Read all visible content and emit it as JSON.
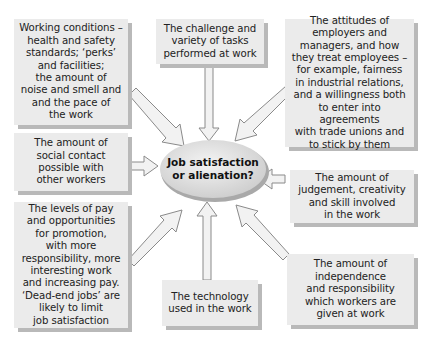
{
  "diagram": {
    "center": {
      "label": "Job satisfaction\nor alienation?"
    },
    "factors": [
      {
        "id": "working-conditions",
        "text": "Working conditions –\nhealth and safety\nstandards; ‘perks’\nand facilities;\nthe amount of\nnoise and smell and\nand the pace of\nthe work"
      },
      {
        "id": "challenge-variety",
        "text": "The challenge and\nvariety of tasks\nperformed at work"
      },
      {
        "id": "attitudes-employers",
        "text": "The attitudes of\nemployers and\nmanagers, and how\nthey treat employees –\nfor example, fairness\nin industrial relations,\nand a willingness both\nto enter into agreements\nwith trade unions and\nto stick by them"
      },
      {
        "id": "social-contact",
        "text": "The amount of\nsocial contact\npossible with\nother workers"
      },
      {
        "id": "judgement-creativity",
        "text": "The amount of\njudgement, creativity\nand skill involved\nin the work"
      },
      {
        "id": "pay-promotion",
        "text": "The levels of pay\nand opportunities\nfor promotion,\nwith more\nresponsibility, more\ninteresting work\nand increasing pay.\n‘Dead-end jobs’ are\nlikely to limit\njob satisfaction"
      },
      {
        "id": "technology",
        "text": "The technology\nused in the work"
      },
      {
        "id": "independence",
        "text": "The amount of\nindependence\nand responsibility\nwhich workers are\ngiven at work"
      }
    ],
    "colors": {
      "box_fill": "#ebebeb",
      "box_shadow": "#b9b9b9",
      "arrow_fill": "#f2f2f2",
      "arrow_stroke": "#8a8a8a",
      "ellipse_fill": "#e6e6e6"
    }
  }
}
